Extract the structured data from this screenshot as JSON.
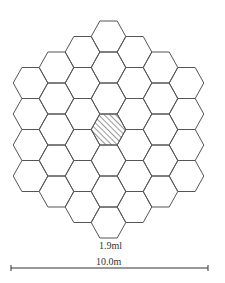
{
  "diagram": {
    "type": "hexagonal-cell-layout",
    "hex_count": 37,
    "column_counts": [
      4,
      5,
      6,
      7,
      6,
      5,
      4
    ],
    "highlighted_cell": {
      "column": 3,
      "row": 3,
      "fill": "hatched"
    },
    "cell_label": "1.9ml",
    "scale_label": "10.0m",
    "stroke_color": "#555555"
  }
}
